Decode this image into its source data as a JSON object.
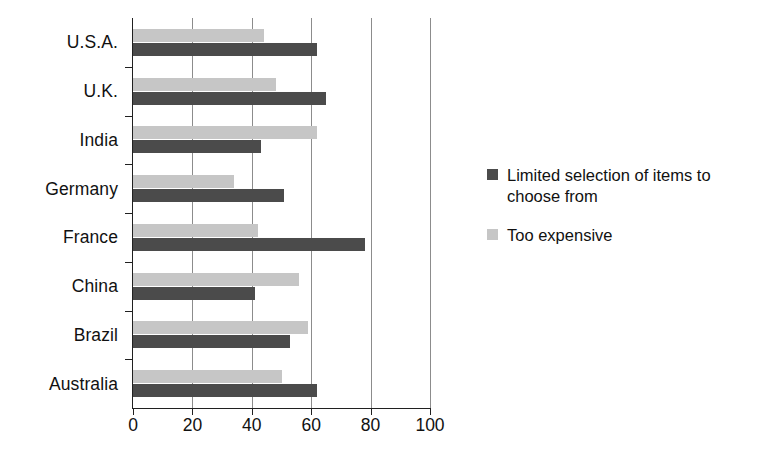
{
  "chart_data": {
    "type": "bar",
    "orientation": "horizontal",
    "title": "",
    "subtitle": "",
    "xlabel": "",
    "ylabel": "",
    "xlim": [
      0,
      100
    ],
    "xticks": [
      0,
      20,
      40,
      60,
      80,
      100
    ],
    "xtick_labels": [
      "0",
      "20",
      "40",
      "60",
      "80",
      "100"
    ],
    "grid": "vertical",
    "legend_position": "right",
    "categories": [
      "U.S.A.",
      "U.K.",
      "India",
      "Germany",
      "France",
      "China",
      "Brazil",
      "Australia"
    ],
    "series": [
      {
        "name": "Limited selection of items to choose from",
        "color": "#4b4b4b",
        "values": [
          62,
          65,
          43,
          51,
          78,
          41,
          53,
          62
        ]
      },
      {
        "name": "Too expensive",
        "color": "#c6c6c6",
        "values": [
          44,
          48,
          62,
          34,
          42,
          56,
          59,
          50
        ]
      }
    ]
  },
  "axis": {
    "tick_labels": [
      "0",
      "20",
      "40",
      "60",
      "80",
      "100"
    ]
  },
  "categories": {
    "c0": "U.S.A.",
    "c1": "U.K.",
    "c2": "India",
    "c3": "Germany",
    "c4": "France",
    "c5": "China",
    "c6": "Brazil",
    "c7": "Australia"
  },
  "legend": {
    "entries": [
      {
        "label": "Limited selection of items to choose from",
        "color": "#4b4b4b"
      },
      {
        "label": "Too expensive",
        "color": "#c6c6c6"
      }
    ]
  },
  "colors": {
    "series_dark": "#4b4b4b",
    "series_light": "#c6c6c6",
    "gridline": "#8c8c8c",
    "axis": "#202020",
    "background": "#ffffff",
    "text": "#111111"
  }
}
